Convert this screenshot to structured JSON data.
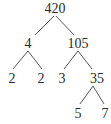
{
  "diagram": {
    "type": "factor-tree",
    "nodes": [
      {
        "id": "n420",
        "label": "420",
        "x": 55,
        "y": 13
      },
      {
        "id": "n4",
        "label": "4",
        "x": 28,
        "y": 48
      },
      {
        "id": "n105",
        "label": "105",
        "x": 78,
        "y": 48
      },
      {
        "id": "n2a",
        "label": "2",
        "x": 12,
        "y": 83
      },
      {
        "id": "n2b",
        "label": "2",
        "x": 41,
        "y": 83
      },
      {
        "id": "n3",
        "label": "3",
        "x": 62,
        "y": 83
      },
      {
        "id": "n35",
        "label": "35",
        "x": 97,
        "y": 83
      },
      {
        "id": "n5",
        "label": "5",
        "x": 78,
        "y": 118
      },
      {
        "id": "n7",
        "label": "7",
        "x": 105,
        "y": 118
      }
    ],
    "edges": [
      {
        "from": "n420",
        "to": "n4",
        "x1": 54,
        "y1": 16,
        "x2": 35,
        "y2": 35
      },
      {
        "from": "n420",
        "to": "n105",
        "x1": 56,
        "y1": 16,
        "x2": 74,
        "y2": 35
      },
      {
        "from": "n4",
        "to": "n2a",
        "x1": 28,
        "y1": 51,
        "x2": 13,
        "y2": 69
      },
      {
        "from": "n4",
        "to": "n2b",
        "x1": 28,
        "y1": 51,
        "x2": 42,
        "y2": 69
      },
      {
        "from": "n105",
        "to": "n3",
        "x1": 78,
        "y1": 51,
        "x2": 64,
        "y2": 69
      },
      {
        "from": "n105",
        "to": "n35",
        "x1": 78,
        "y1": 51,
        "x2": 92,
        "y2": 69
      },
      {
        "from": "n35",
        "to": "n5",
        "x1": 93,
        "y1": 86,
        "x2": 80,
        "y2": 104
      },
      {
        "from": "n35",
        "to": "n7",
        "x1": 93,
        "y1": 86,
        "x2": 104,
        "y2": 104
      }
    ]
  }
}
